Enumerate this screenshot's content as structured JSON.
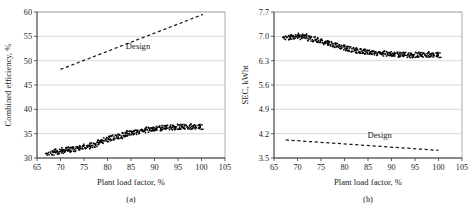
{
  "figure": {
    "name": "plant-performance-two-panel-figure",
    "background": "#ffffff",
    "point_color": "#000000",
    "grid_color": "#bfbfbf",
    "frame_color": "#9a9a9a"
  },
  "panels": [
    {
      "key": "a",
      "caption": "(a)",
      "series_label": "Design"
    },
    {
      "key": "b",
      "caption": "(b)",
      "series_label": "Design"
    }
  ],
  "chart_data": [
    {
      "type": "scatter",
      "panel": "(a)",
      "title": "",
      "xlabel": "Plant load factor, %",
      "ylabel": "Combined efficiency, %",
      "xlim": [
        65,
        105
      ],
      "ylim": [
        30,
        60
      ],
      "xticks": [
        65,
        70,
        75,
        80,
        85,
        90,
        95,
        100,
        105
      ],
      "yticks": [
        30,
        35,
        40,
        45,
        50,
        55,
        60
      ],
      "grid": "horizontal",
      "legend_position": "inline-annotation",
      "annotations": [
        {
          "text": "Design",
          "x": 86.5,
          "y": 52.3
        }
      ],
      "series": [
        {
          "name": "Design",
          "style": "dashed-line",
          "x": [
            70.0,
            100.3
          ],
          "values": [
            48.2,
            59.5
          ]
        },
        {
          "name": "Measured combined efficiency",
          "style": "scatter",
          "x": [
            67.3,
            67.9,
            68.4,
            68.8,
            69.2,
            69.6,
            70.0,
            70.3,
            70.7,
            71.0,
            71.4,
            71.8,
            72.1,
            72.5,
            72.9,
            73.2,
            73.6,
            74.0,
            74.4,
            74.8,
            75.2,
            75.6,
            76.0,
            76.4,
            76.8,
            77.2,
            77.6,
            78.0,
            78.4,
            78.8,
            79.2,
            79.6,
            80.0,
            80.4,
            80.8,
            81.2,
            81.6,
            82.0,
            82.4,
            82.8,
            83.2,
            83.6,
            84.0,
            84.4,
            84.8,
            85.2,
            85.6,
            86.0,
            86.4,
            86.8,
            87.2,
            87.6,
            88.0,
            88.4,
            88.8,
            89.2,
            89.6,
            90.0,
            90.4,
            90.8,
            91.2,
            91.6,
            92.0,
            92.4,
            92.8,
            93.2,
            93.6,
            94.0,
            94.4,
            94.8,
            95.2,
            95.6,
            96.0,
            96.4,
            96.8,
            97.2,
            97.6,
            98.0,
            98.4,
            98.8,
            99.2,
            99.6,
            100.0
          ],
          "values": [
            30.8,
            30.9,
            31.0,
            31.3,
            31.2,
            31.0,
            31.4,
            31.5,
            31.3,
            31.4,
            31.6,
            31.5,
            31.7,
            31.6,
            31.8,
            31.7,
            32.0,
            31.9,
            32.1,
            32.0,
            32.2,
            32.3,
            32.2,
            32.4,
            32.5,
            32.6,
            32.8,
            33.0,
            33.1,
            33.3,
            33.4,
            33.6,
            33.7,
            33.9,
            34.0,
            34.1,
            34.2,
            34.3,
            34.4,
            34.4,
            34.5,
            34.6,
            34.8,
            34.9,
            35.0,
            35.1,
            35.2,
            35.2,
            35.3,
            35.4,
            35.5,
            35.5,
            35.6,
            35.7,
            35.7,
            35.8,
            35.8,
            35.9,
            35.9,
            36.0,
            36.0,
            36.0,
            36.1,
            36.1,
            36.1,
            36.2,
            36.2,
            36.2,
            36.2,
            36.2,
            36.3,
            36.3,
            36.3,
            36.3,
            36.3,
            36.3,
            36.3,
            36.3,
            36.3,
            36.3,
            36.3,
            36.3,
            36.3
          ]
        }
      ]
    },
    {
      "type": "scatter",
      "panel": "(b)",
      "title": "",
      "xlabel": "Plant load factor, %",
      "ylabel": "SEC, kWht",
      "xlim": [
        65,
        105
      ],
      "ylim": [
        3.5,
        7.7
      ],
      "xticks": [
        65,
        70,
        75,
        80,
        85,
        90,
        95,
        100,
        105
      ],
      "yticks": [
        3.5,
        4.2,
        4.9,
        5.6,
        6.3,
        7.0,
        7.7
      ],
      "grid": "horizontal",
      "legend_position": "inline-annotation",
      "annotations": [
        {
          "text": "Design",
          "x": 87.5,
          "y": 4.08
        }
      ],
      "series": [
        {
          "name": "Design",
          "style": "dashed-line",
          "x": [
            67.5,
            100.0
          ],
          "values": [
            4.02,
            3.72
          ]
        },
        {
          "name": "Measured SEC",
          "style": "scatter",
          "x": [
            67.3,
            67.8,
            68.2,
            68.6,
            69.0,
            69.4,
            69.8,
            70.2,
            70.6,
            71.0,
            71.4,
            71.8,
            72.2,
            72.6,
            73.0,
            73.4,
            73.8,
            74.2,
            74.6,
            75.0,
            75.4,
            75.8,
            76.2,
            76.6,
            77.0,
            77.4,
            77.8,
            78.2,
            78.6,
            79.0,
            79.4,
            79.8,
            80.2,
            80.6,
            81.0,
            81.4,
            81.8,
            82.2,
            82.6,
            83.0,
            83.4,
            83.8,
            84.2,
            84.6,
            85.0,
            85.4,
            85.8,
            86.2,
            86.6,
            87.0,
            87.4,
            87.8,
            88.2,
            88.6,
            89.0,
            89.4,
            89.8,
            90.2,
            90.6,
            91.0,
            91.4,
            91.8,
            92.2,
            92.6,
            93.0,
            93.4,
            93.8,
            94.2,
            94.6,
            95.0,
            95.4,
            95.8,
            96.2,
            96.6,
            97.0,
            97.4,
            97.8,
            98.2,
            98.6,
            99.0,
            99.4,
            99.8,
            100.2
          ],
          "values": [
            6.96,
            6.94,
            6.97,
            6.95,
            6.98,
            6.96,
            6.99,
            7.0,
            6.98,
            6.97,
            6.95,
            6.99,
            6.96,
            6.93,
            6.92,
            6.9,
            6.88,
            6.87,
            6.85,
            6.84,
            6.83,
            6.81,
            6.8,
            6.79,
            6.77,
            6.76,
            6.74,
            6.73,
            6.71,
            6.69,
            6.68,
            6.66,
            6.64,
            6.63,
            6.62,
            6.61,
            6.6,
            6.59,
            6.58,
            6.57,
            6.56,
            6.55,
            6.54,
            6.54,
            6.53,
            6.53,
            6.52,
            6.52,
            6.51,
            6.51,
            6.5,
            6.5,
            6.49,
            6.49,
            6.48,
            6.48,
            6.48,
            6.47,
            6.47,
            6.47,
            6.46,
            6.46,
            6.46,
            6.45,
            6.45,
            6.45,
            6.44,
            6.44,
            6.44,
            6.45,
            6.45,
            6.46,
            6.46,
            6.45,
            6.45,
            6.46,
            6.45,
            6.46,
            6.45,
            6.45,
            6.46,
            6.45,
            6.45
          ]
        }
      ]
    }
  ]
}
